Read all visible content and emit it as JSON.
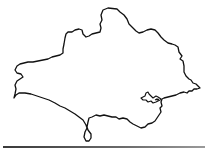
{
  "map": {
    "title": "Dorset outline map",
    "region": "Dorset",
    "style": "black outline on white",
    "colors": {
      "background": "#ffffff",
      "outline": "#111111",
      "rule": "#6b6b6b"
    },
    "features": [
      {
        "name": "county-boundary",
        "type": "outline"
      },
      {
        "name": "poole-harbour",
        "type": "inlet"
      },
      {
        "name": "isle-of-portland",
        "type": "peninsula"
      }
    ]
  }
}
